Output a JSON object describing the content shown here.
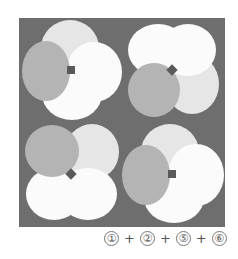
{
  "colors": {
    "board": "#6e6e6e",
    "white": "#fbfbfb",
    "light": "#e6e6e6",
    "mid": "#b4b4b4",
    "marker": "#5a5a5a"
  },
  "figures": [
    {
      "name": "figure-top-left",
      "marker": "square"
    },
    {
      "name": "figure-top-right",
      "marker": "diamond"
    },
    {
      "name": "figure-bottom-left",
      "marker": "diamond"
    },
    {
      "name": "figure-bottom-right",
      "marker": "square"
    }
  ],
  "answer": {
    "items": [
      "①",
      "②",
      "⑤",
      "⑥"
    ],
    "separator": "+"
  }
}
